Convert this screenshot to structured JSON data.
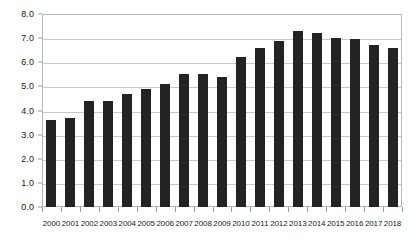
{
  "chart_data": {
    "type": "bar",
    "title": "",
    "subtitle": "",
    "xlabel": "",
    "ylabel": "",
    "categories": [
      "2000",
      "2001",
      "2002",
      "2003",
      "2004",
      "2005",
      "2006",
      "2007",
      "2008",
      "2009",
      "2010",
      "2011",
      "2012",
      "2013",
      "2014",
      "2015",
      "2016",
      "2017",
      "2018"
    ],
    "values": [
      3.6,
      3.7,
      4.4,
      4.4,
      4.7,
      4.9,
      5.1,
      5.5,
      5.5,
      5.4,
      6.2,
      6.6,
      6.9,
      7.3,
      7.2,
      7.0,
      6.95,
      6.7,
      6.6
    ],
    "series": [
      {
        "name": "",
        "values": [
          3.6,
          3.7,
          4.4,
          4.4,
          4.7,
          4.9,
          5.1,
          5.5,
          5.5,
          5.4,
          6.2,
          6.6,
          6.9,
          7.3,
          7.2,
          7.0,
          6.95,
          6.7,
          6.6
        ]
      }
    ],
    "ylim": [
      0,
      8
    ],
    "ytick_values": [
      0,
      1,
      2,
      3,
      4,
      5,
      6,
      7,
      8
    ],
    "ytick_labels": [
      "0.0",
      "1.0",
      "2.0",
      "3.0",
      "4.0",
      "5.0",
      "6.0",
      "7.0",
      "8.0"
    ],
    "xtick_labels": [
      "2000",
      "2001",
      "2002",
      "2003",
      "2004",
      "2005",
      "2006",
      "2007",
      "2008",
      "2009",
      "2010",
      "2011",
      "2012",
      "2013",
      "2014",
      "2015",
      "2016",
      "2017",
      "2018"
    ],
    "grid": true,
    "grid_axis": "y",
    "legend": false,
    "legend_position": "none",
    "annotations": [],
    "bar_color": "#232323",
    "gridline_color": "#c9c9c9",
    "axis_color": "#b8b8b8",
    "background_color": "#ffffff",
    "text_color": "#1a1a1a"
  }
}
